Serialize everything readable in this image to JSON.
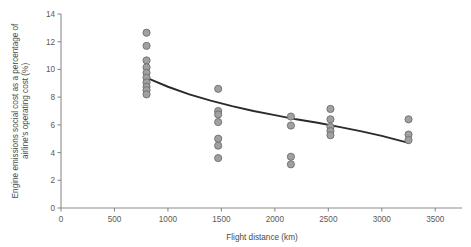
{
  "chart_data": {
    "type": "scatter",
    "title": "",
    "xlabel": "Flight distance (km)",
    "ylabel": "Engine emissions social cost as a percentage of airline's operating cost (%)",
    "ylabel_line1": "Engine emissions social cost as a percentage of",
    "ylabel_line2": "airline's operating cost (%)",
    "xlim": [
      0,
      3750
    ],
    "ylim": [
      0,
      14
    ],
    "xticks": [
      0,
      500,
      1000,
      1500,
      2000,
      2500,
      3000,
      3500
    ],
    "xtick_labels": [
      "0",
      "500",
      "1000",
      "1500",
      "2000",
      "2500",
      "3000",
      "3500"
    ],
    "yticks": [
      0,
      2,
      4,
      6,
      8,
      10,
      12,
      14
    ],
    "ytick_labels": [
      "0",
      "2",
      "4",
      "6",
      "8",
      "10",
      "12",
      "14"
    ],
    "grid": false,
    "legend": false,
    "marker_color": "#a0a0a0",
    "marker_edge_color": "#6e6e6e",
    "marker_radius_px": 3.6,
    "line_color": "#2b2b2b",
    "axis_color": "#8c8c8c",
    "points": [
      {
        "x": 800,
        "y": 12.65
      },
      {
        "x": 800,
        "y": 11.7
      },
      {
        "x": 800,
        "y": 10.65
      },
      {
        "x": 800,
        "y": 10.15
      },
      {
        "x": 800,
        "y": 9.75
      },
      {
        "x": 800,
        "y": 9.4
      },
      {
        "x": 800,
        "y": 9.05
      },
      {
        "x": 800,
        "y": 8.75
      },
      {
        "x": 800,
        "y": 8.5
      },
      {
        "x": 800,
        "y": 8.2
      },
      {
        "x": 1470,
        "y": 8.6
      },
      {
        "x": 1470,
        "y": 7.0
      },
      {
        "x": 1470,
        "y": 6.75
      },
      {
        "x": 1470,
        "y": 6.2
      },
      {
        "x": 1470,
        "y": 5.0
      },
      {
        "x": 1470,
        "y": 4.5
      },
      {
        "x": 1470,
        "y": 3.6
      },
      {
        "x": 2150,
        "y": 6.6
      },
      {
        "x": 2150,
        "y": 5.95
      },
      {
        "x": 2150,
        "y": 3.7
      },
      {
        "x": 2150,
        "y": 3.15
      },
      {
        "x": 2520,
        "y": 7.15
      },
      {
        "x": 2520,
        "y": 6.4
      },
      {
        "x": 2520,
        "y": 5.85
      },
      {
        "x": 2520,
        "y": 5.55
      },
      {
        "x": 2520,
        "y": 5.25
      },
      {
        "x": 3250,
        "y": 6.4
      },
      {
        "x": 3250,
        "y": 5.3
      },
      {
        "x": 3250,
        "y": 4.9
      }
    ],
    "trend_line": {
      "name": "fitted decay curve",
      "x": [
        830,
        1000,
        1200,
        1400,
        1600,
        1800,
        2000,
        2200,
        2400,
        2600,
        2800,
        3000,
        3250
      ],
      "y": [
        9.3,
        8.75,
        8.2,
        7.75,
        7.35,
        7.0,
        6.7,
        6.4,
        6.15,
        5.85,
        5.55,
        5.2,
        4.7
      ]
    }
  }
}
